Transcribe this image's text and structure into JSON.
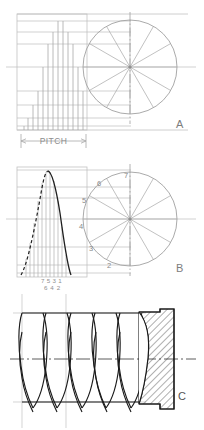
{
  "sheet": {
    "width": 204,
    "height": 430,
    "background": "#ffffff",
    "description": "Engineering construction drawing of a worm / helical thread: three stacked figures labelled A, B and C"
  },
  "colors": {
    "construction_line": "#b9b9b9",
    "light_line": "#c9c9c9",
    "medium_line": "#9a9a9a",
    "dark_line": "#1a1a1a",
    "centerline": "#8d8d8d",
    "hatch": "#2b2b2b",
    "label_text": "#6f6f6f",
    "small_text": "#8a8a8a",
    "background": "#ffffff"
  },
  "figures": [
    {
      "id": "figure-a",
      "label": "A",
      "caption_label": "A",
      "type": "pitch-construction",
      "dimension_label": "PITCH",
      "circle": {
        "center_x": 130,
        "center_y": 67,
        "radius": 47,
        "spokes": 12,
        "spoke_step_degrees": 30
      },
      "ordinate_count": 12,
      "notes": "Divided circle projected to a stepped ordinate (staircase) diagram at the left; horizontal dimension marked PITCH"
    },
    {
      "id": "figure-b",
      "label": "B",
      "caption_label": "B",
      "type": "displacement-curve",
      "circle": {
        "center_x": 130,
        "center_y": 219,
        "radius": 47,
        "spokes": 12,
        "spoke_step_degrees": 30
      },
      "circle_point_labels": [
        "2",
        "3",
        "4",
        "5",
        "6",
        "7"
      ],
      "baseline_labels_top": [
        "7",
        "5",
        "3",
        "1"
      ],
      "baseline_labels_bottom": [
        "6",
        "4",
        "2"
      ],
      "curve": {
        "rising_flank_style": "dashed",
        "falling_flank_style": "solid",
        "peak_x": 47,
        "peak_y": 172
      },
      "notes": "Cam displacement curve generated by projecting the numbered divisions of the circle onto vertical ordinates"
    },
    {
      "id": "figure-c",
      "label": "C",
      "caption_label": "C",
      "type": "worm-thread-section",
      "thread_turns": 4,
      "centerline": true,
      "section_hatched": true,
      "hatch_angle_degrees": 45,
      "hatch_spacing": 5,
      "notes": "Finished helical worm thread shown in elevation with a stepped sectioned (hatched) end boss at the right"
    }
  ],
  "text_items": {
    "pitch": "PITCH",
    "label_a": "A",
    "label_b": "B",
    "label_c": "C",
    "numbers_row_top": "7 5 3 1",
    "numbers_row_bottom": "6 4 2",
    "circle_numbers": "2 3 4 5 6 7"
  }
}
